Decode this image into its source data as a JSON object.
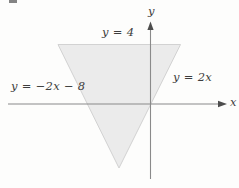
{
  "figure": {
    "axes": {
      "x_label": "x",
      "y_label": "y",
      "line_color": "#8a8a8a",
      "arrow_color": "#4d4d4d"
    },
    "region": {
      "fill": "#ebebeb",
      "stroke": "#d2d2d2"
    },
    "labels": {
      "top_line": "y = 4",
      "right_line": "y = 2x",
      "left_line": "y = −2x − 8"
    },
    "text_color": "#3d3d3d"
  }
}
